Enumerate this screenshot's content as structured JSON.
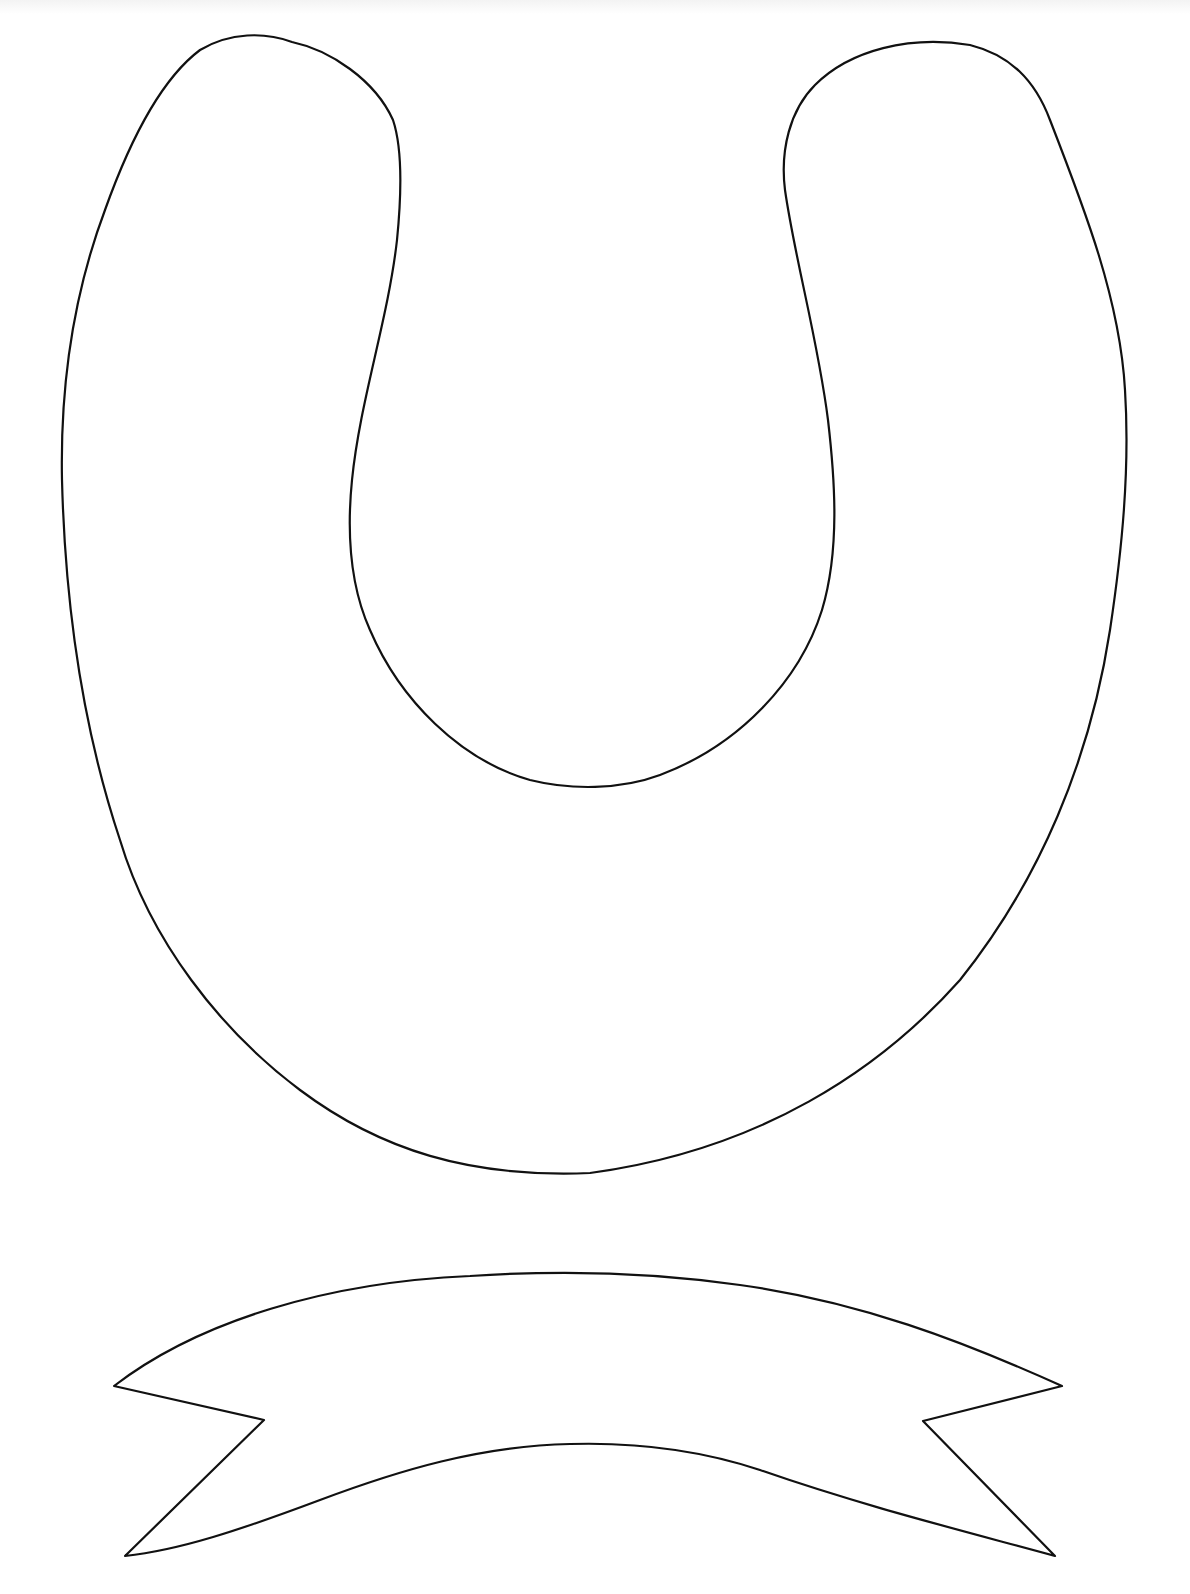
{
  "page": {
    "description": "Printable outline template: horseshoe with banner ribbon",
    "background_color": "#ffffff",
    "stroke_color": "#111111"
  },
  "shapes": [
    {
      "name": "horseshoe",
      "type": "outline"
    },
    {
      "name": "banner-ribbon",
      "type": "outline"
    }
  ]
}
